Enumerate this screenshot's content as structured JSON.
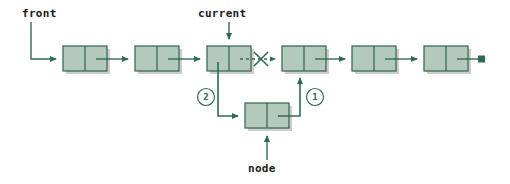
{
  "diagram": {
    "colors": {
      "node_fill": "#b3c9bc",
      "node_stroke": "#3d6b55",
      "arrow": "#2f6b52",
      "label_text": "#1a1a1a",
      "shadow": "#c9cfcb",
      "background": "#ffffff"
    },
    "pointer_labels": [
      {
        "id": "front",
        "text": "front",
        "target": "node-1",
        "direction": "down-right"
      },
      {
        "id": "current",
        "text": "current",
        "target": "node-3",
        "direction": "down"
      },
      {
        "id": "node",
        "text": "node",
        "target": "node-new",
        "direction": "up"
      }
    ],
    "step_markers": [
      {
        "id": "step-2",
        "text": "2",
        "description": "current.next points to new node"
      },
      {
        "id": "step-1",
        "text": "1",
        "description": "new node next points to following node"
      }
    ],
    "list_nodes": [
      {
        "id": "node-1",
        "index": 0
      },
      {
        "id": "node-2",
        "index": 1
      },
      {
        "id": "node-3",
        "index": 2
      },
      {
        "id": "node-4",
        "index": 3
      },
      {
        "id": "node-5",
        "index": 4
      },
      {
        "id": "node-6",
        "index": 5
      }
    ],
    "inserted_node": {
      "id": "node-new",
      "index": 6
    },
    "broken_link": {
      "id": "cut-link",
      "marker": "X",
      "style": "dashed",
      "from": "node-3",
      "to": "node-4"
    },
    "terminator": {
      "id": "null-terminator",
      "shape": "filled-square"
    }
  }
}
